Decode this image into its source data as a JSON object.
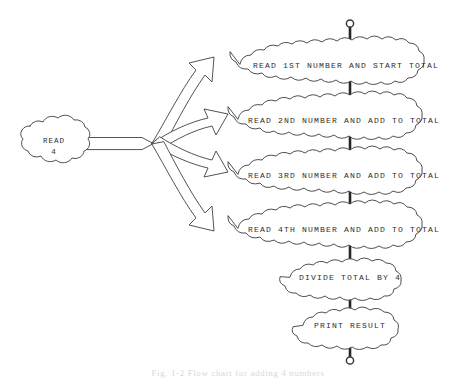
{
  "figure": {
    "kind": "flowchart",
    "caption": "Fig. 1-2  Flow chart for adding 4 numbers",
    "background_color": "#ffffff",
    "line_color": "#3b3b3b",
    "text_color": "#2e2e2e"
  },
  "source_node": {
    "label_line1": "READ",
    "label_line2": "4",
    "shape": "cloud"
  },
  "fan_connector": {
    "name": "fan-out-arrow",
    "branch_count": 4,
    "style": "hollow-outline"
  },
  "terminators": {
    "top": "open-circle",
    "bottom": "open-circle"
  },
  "steps": [
    {
      "id": "step-1",
      "label": "READ 1ST NUMBER AND START TOTAL",
      "shape": "cloud",
      "receives_branch": true
    },
    {
      "id": "step-2",
      "label": "READ 2ND NUMBER AND ADD TO TOTAL",
      "shape": "cloud",
      "receives_branch": true
    },
    {
      "id": "step-3",
      "label": "READ 3RD NUMBER AND ADD TO TOTAL",
      "shape": "cloud",
      "receives_branch": true
    },
    {
      "id": "step-4",
      "label": "READ 4TH NUMBER AND ADD TO TOTAL",
      "shape": "cloud",
      "receives_branch": true
    },
    {
      "id": "step-5",
      "label": "DIVIDE TOTAL BY 4",
      "shape": "cloud",
      "receives_branch": false
    },
    {
      "id": "step-6",
      "label": "PRINT RESULT",
      "shape": "cloud",
      "receives_branch": false
    }
  ]
}
